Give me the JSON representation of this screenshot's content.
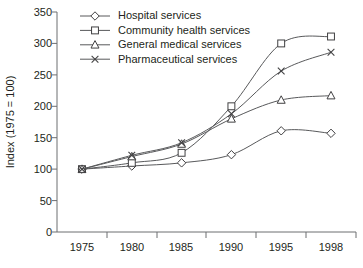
{
  "chart_data": {
    "type": "line",
    "title": "",
    "xlabel": "",
    "ylabel": "Index (1975 = 100)",
    "categories": [
      "1975",
      "1980",
      "1985",
      "1990",
      "1995",
      "1998"
    ],
    "x": [
      1975,
      1980,
      1985,
      1990,
      1995,
      1998
    ],
    "ylim": [
      0,
      350
    ],
    "yticks": [
      0,
      50,
      100,
      150,
      200,
      250,
      300,
      350
    ],
    "ytick_labels": [
      "0",
      "50",
      "100",
      "150",
      "200",
      "250",
      "300",
      "350"
    ],
    "xtick_labels": [
      "1975",
      "1980",
      "1985",
      "1990",
      "1995",
      "1998"
    ],
    "grid": false,
    "legend_position": "top-left-inside",
    "series": [
      {
        "name": "Hospital services",
        "marker": "diamond",
        "values": [
          100,
          105,
          110,
          123,
          161,
          157
        ]
      },
      {
        "name": "Community health services",
        "marker": "square",
        "values": [
          100,
          110,
          126,
          200,
          300,
          311
        ]
      },
      {
        "name": "General medical services",
        "marker": "triangle",
        "values": [
          100,
          120,
          140,
          180,
          210,
          217
        ]
      },
      {
        "name": "Pharmaceutical services",
        "marker": "cross-x",
        "values": [
          100,
          122,
          142,
          188,
          256,
          286
        ]
      }
    ],
    "colors": {
      "line": "#58595b",
      "marker_stroke": "#414042",
      "marker_fill": "#ffffff",
      "axis": "#6d6e71",
      "text": "#231f20",
      "background": "#ffffff"
    }
  },
  "legend": {
    "items": [
      {
        "label": "Hospital services",
        "icon": "diamond-marker-icon"
      },
      {
        "label": "Community health services",
        "icon": "square-marker-icon"
      },
      {
        "label": "General medical services",
        "icon": "triangle-marker-icon"
      },
      {
        "label": "Pharmaceutical services",
        "icon": "x-marker-icon"
      }
    ]
  },
  "axes": {
    "y_title": "Index (1975 = 100)"
  }
}
